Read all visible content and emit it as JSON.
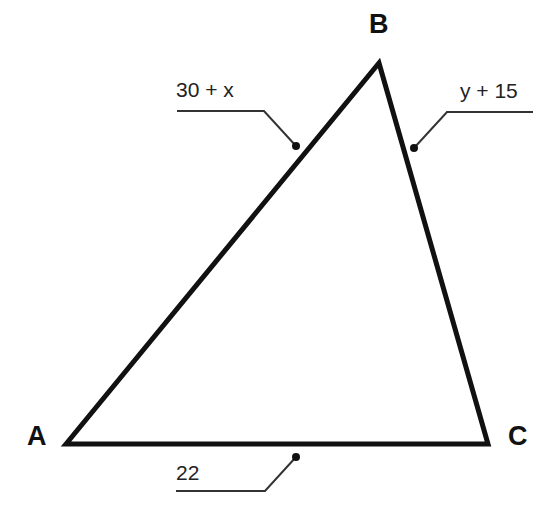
{
  "diagram": {
    "type": "triangle",
    "vertices": [
      {
        "name": "A",
        "x": 66,
        "y": 444
      },
      {
        "name": "B",
        "x": 379,
        "y": 63
      },
      {
        "name": "C",
        "x": 488,
        "y": 444
      }
    ],
    "vertex_labels": {
      "A": "A",
      "B": "B",
      "C": "C"
    },
    "side_labels": {
      "AB": "30 + x",
      "BC": "y + 15",
      "AC": "22"
    },
    "colors": {
      "stroke": "#111111",
      "background": "#ffffff",
      "leader": "#333333"
    }
  }
}
